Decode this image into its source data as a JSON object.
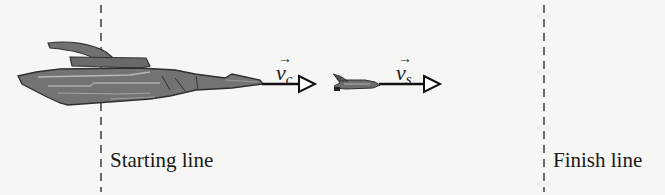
{
  "diagram": {
    "type": "race-illustration",
    "lines": [
      {
        "id": "start",
        "label": "Starting line",
        "x": 101
      },
      {
        "id": "finish",
        "label": "Finish line",
        "x": 544
      }
    ],
    "objects": [
      {
        "id": "cruiser",
        "kind": "large spaceship",
        "velocity_label": {
          "symbol": "v",
          "subscript": "c"
        }
      },
      {
        "id": "shuttle",
        "kind": "small space shuttle",
        "velocity_label": {
          "symbol": "v",
          "subscript": "s"
        }
      }
    ],
    "colors": {
      "ink": "#1a1a1a",
      "ship_fill": "#6e6e6e",
      "ship_highlight": "#b4b4b4",
      "background": "#f6f6f4"
    }
  }
}
